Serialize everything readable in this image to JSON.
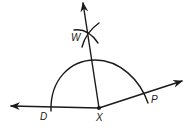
{
  "diagram": {
    "type": "angle-bisector-construction",
    "points": [
      {
        "name": "D",
        "label": "D"
      },
      {
        "name": "X",
        "label": "X"
      },
      {
        "name": "P",
        "label": "P"
      },
      {
        "name": "W",
        "label": "W"
      }
    ],
    "vertex": "X",
    "rays": [
      "XD",
      "XP",
      "XW"
    ],
    "arcs": [
      "arc centered at X through D and P",
      "intersecting arcs at W"
    ],
    "colors": {
      "stroke": "#1a1a1a",
      "background": "#ffffff"
    }
  }
}
